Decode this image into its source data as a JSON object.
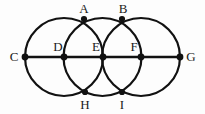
{
  "figure": {
    "background_color": "#fdfdfd",
    "stroke_color": "#111111",
    "label_color": "#1a1a1a",
    "canvas": {
      "width": 205,
      "height": 114
    },
    "circles": [
      {
        "name": "left-circle",
        "cx": 64.0,
        "cy": 57.0,
        "r": 39.0
      },
      {
        "name": "middle-circle",
        "cx": 102.5,
        "cy": 57.0,
        "r": 39.0
      },
      {
        "name": "right-circle",
        "cx": 141.0,
        "cy": 57.0,
        "r": 39.0
      }
    ],
    "baseline": {
      "name": "horizontal-diameter-line",
      "x1": 25,
      "y1": 57,
      "x2": 180,
      "y2": 57
    },
    "points": [
      {
        "id": "A",
        "label": "A",
        "x": 84,
        "y": 19,
        "label_x": 84,
        "label_y": 8,
        "position": "above"
      },
      {
        "id": "B",
        "label": "B",
        "x": 122,
        "y": 19,
        "label_x": 123,
        "label_y": 8,
        "position": "above"
      },
      {
        "id": "C",
        "label": "C",
        "x": 25,
        "y": 57,
        "label_x": 14,
        "label_y": 56,
        "position": "left"
      },
      {
        "id": "D",
        "label": "D",
        "x": 64,
        "y": 57,
        "label_x": 58,
        "label_y": 46,
        "position": "upper-left"
      },
      {
        "id": "E",
        "label": "E",
        "x": 103,
        "y": 57,
        "label_x": 96,
        "label_y": 46,
        "position": "upper-left"
      },
      {
        "id": "F",
        "label": "F",
        "x": 141,
        "y": 57,
        "label_x": 134,
        "label_y": 46,
        "position": "upper-left"
      },
      {
        "id": "G",
        "label": "G",
        "x": 180,
        "y": 57,
        "label_x": 191,
        "label_y": 56,
        "position": "right"
      },
      {
        "id": "H",
        "label": "H",
        "x": 85,
        "y": 92,
        "label_x": 85,
        "label_y": 104,
        "position": "below"
      },
      {
        "id": "I",
        "label": "I",
        "x": 122,
        "y": 92,
        "label_x": 122,
        "label_y": 104,
        "position": "below"
      }
    ]
  }
}
